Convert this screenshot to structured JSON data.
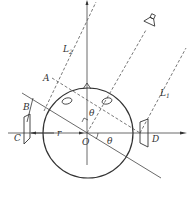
{
  "diagram": {
    "labels": {
      "A": "A",
      "B": "B",
      "C": "C",
      "D": "D",
      "O": "O",
      "r": "r",
      "theta1": "θ",
      "theta2": "θ",
      "L1": "L",
      "L1_sub": "1",
      "L2": "L",
      "L2_sub": "2"
    },
    "colors": {
      "line": "#333333",
      "background": "#ffffff"
    }
  }
}
